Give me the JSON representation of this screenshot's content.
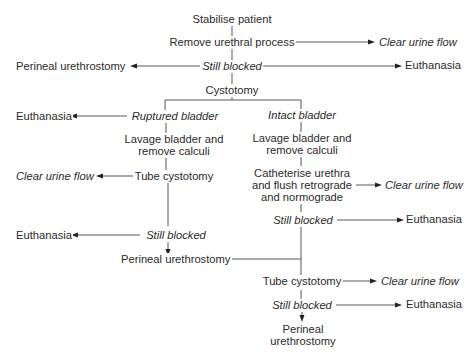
{
  "diagram": {
    "nodes": {
      "stabilise": "Stabilise patient",
      "remove_process": "Remove urethral process",
      "clear1": "Clear urine flow",
      "still_blocked1": "Still blocked",
      "perineal1": "Perineal urethrostomy",
      "euth1": "Euthanasia",
      "cystotomy": "Cystotomy",
      "ruptured": "Ruptured bladder",
      "intact": "Intact bladder",
      "euth2": "Euthanasia",
      "lavage_l1": "Lavage bladder and",
      "lavage_l2": "remove calculi",
      "lavage_r1": "Lavage bladder and",
      "lavage_r2": "remove calculi",
      "tube_l": "Tube cystotomy",
      "clear2": "Clear urine flow",
      "cath1": "Catheterise urethra",
      "cath2": "and flush retrograde",
      "cath3": "and normograde",
      "clear3": "Clear urine flow",
      "still_blocked_r": "Still blocked",
      "euth3": "Euthanasia",
      "still_blocked_l": "Still blocked",
      "euth4": "Euthanasia",
      "perineal2": "Perineal urethrostomy",
      "tube_r": "Tube cystotomy",
      "clear4": "Clear urine flow",
      "still_blocked_r2": "Still blocked",
      "euth5": "Euthanasia",
      "perineal3_1": "Perineal",
      "perineal3_2": "urethrostomy"
    },
    "colors": {
      "line": "#444444",
      "text": "#2a2a2a",
      "background": "#ffffff"
    }
  }
}
